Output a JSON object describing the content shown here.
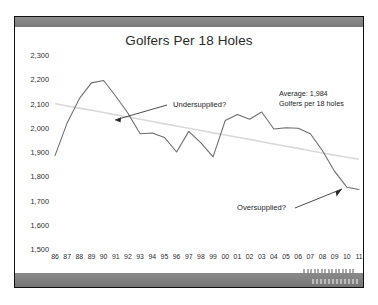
{
  "slide": {
    "title": "Golfers Per 18 Holes",
    "source_note": "Source: National Golf Foundation",
    "watermark": ""
  },
  "annotations": {
    "undersupplied": "Undersupplied?",
    "oversupplied": "Oversupplied?",
    "average_line1": "Average:  1,984",
    "average_line2": "Golfers per 18 holes"
  },
  "chart_data": {
    "type": "line",
    "title": "Golfers Per 18 Holes",
    "xlabel": "",
    "ylabel": "",
    "ylim": [
      1500,
      2300
    ],
    "ytick_step": 100,
    "yticks": [
      "2,300",
      "2,200",
      "2,100",
      "2,000",
      "1,900",
      "1,800",
      "1,700",
      "1,600",
      "1,500"
    ],
    "grid": false,
    "legend": "none",
    "categories": [
      "86",
      "87",
      "88",
      "89",
      "90",
      "91",
      "92",
      "93",
      "94",
      "95",
      "96",
      "97",
      "98",
      "99",
      "00",
      "01",
      "02",
      "03",
      "04",
      "05",
      "06",
      "07",
      "08",
      "09",
      "10",
      "11"
    ],
    "series": [
      {
        "name": "Golfers per 18 holes",
        "color": "#6b6b6b",
        "values": [
          1885,
          2020,
          2120,
          2185,
          2195,
          2130,
          2060,
          1975,
          1978,
          1960,
          1900,
          1985,
          1938,
          1880,
          2030,
          2055,
          2035,
          2065,
          1995,
          2000,
          1998,
          1975,
          1905,
          1820,
          1755,
          1745
        ]
      },
      {
        "name": "Trend",
        "color": "#d9d9d9",
        "values": [
          2100,
          2090,
          2081,
          2072,
          2063,
          2053,
          2044,
          2035,
          2026,
          2016,
          2007,
          1998,
          1989,
          1979,
          1970,
          1961,
          1952,
          1942,
          1933,
          1924,
          1915,
          1905,
          1896,
          1887,
          1878,
          1870
        ]
      }
    ],
    "average": 1984
  }
}
